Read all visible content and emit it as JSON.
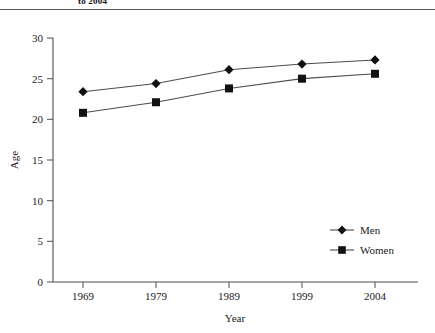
{
  "figure": {
    "caption_fragment": "to 2004",
    "top_rule": true
  },
  "chart_data": {
    "type": "line",
    "title": "",
    "xlabel": "Year",
    "ylabel": "Age",
    "categories": [
      "1969",
      "1979",
      "1989",
      "1999",
      "2004"
    ],
    "x": [
      1969,
      1979,
      1989,
      1999,
      2004
    ],
    "series": [
      {
        "name": "Men",
        "marker": "diamond",
        "values": [
          23.4,
          24.4,
          26.1,
          26.8,
          27.3
        ]
      },
      {
        "name": "Women",
        "marker": "square",
        "values": [
          20.8,
          22.1,
          23.8,
          25.0,
          25.6
        ]
      }
    ],
    "ylim": [
      0,
      30
    ],
    "yticks": [
      "0",
      "5",
      "10",
      "15",
      "20",
      "25",
      "30"
    ],
    "ytick_values": [
      0,
      5,
      10,
      15,
      20,
      25,
      30
    ],
    "xticks": [
      "1969",
      "1979",
      "1989",
      "1999",
      "2004"
    ],
    "grid": false,
    "legend_position": "lower-right",
    "line_color": "#4d4d4d",
    "marker_color": "#111111",
    "axis_color": "#4d4d4d"
  }
}
